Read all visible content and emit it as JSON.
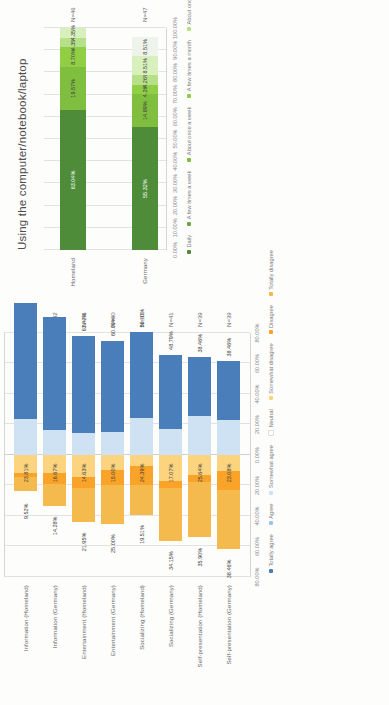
{
  "page": {
    "background": "#fdfdfc",
    "rotation_note": "scanned page oriented 90 degrees counter-clockwise"
  },
  "chart_data": [
    {
      "id": "likert-chart",
      "type": "bar",
      "subtype": "diverging-stacked-bar",
      "title": "",
      "xlabel": "",
      "ylabel": "",
      "grid": true,
      "legend_position": "bottom",
      "xlim": [
        -80,
        80
      ],
      "xtick_labels": [
        "80.00%",
        "60.00%",
        "40.00%",
        "20.00%",
        "0.00%",
        "20.00%",
        "40.00%",
        "60.00%",
        "80.00%"
      ],
      "xtick_values": [
        -80,
        -60,
        -40,
        -20,
        0,
        20,
        40,
        60,
        80
      ],
      "categories": [
        "Information (Homeland)",
        "Information (Germany)",
        "Entertainment (Homeland)",
        "Entertainment (Germany)",
        "Socializing (Homeland)",
        "Socializing (Germany)",
        "Self-presentation (Homeland)",
        "Self-presentation (Germany)"
      ],
      "n_labels": [
        "N=42",
        "N=42",
        "N=41",
        "N=40",
        "N=41",
        "N=41",
        "N=39",
        "N=39"
      ],
      "series": [
        {
          "name": "Totally disagree",
          "color": "#f5ba4e",
          "values": [
            9.52,
            14.28,
            21.95,
            25.0,
            19.51,
            34.15,
            35.9,
            38.46
          ]
        },
        {
          "name": "Disagree",
          "color": "#f9a328",
          "values": [
            2.38,
            7.14,
            7.32,
            10.0,
            12.2,
            4.88,
            5.13,
            12.82
          ]
        },
        {
          "name": "Somewhat disagree",
          "color": "#fcd37f",
          "values": [
            11.9,
            11.9,
            14.63,
            10.0,
            7.32,
            17.07,
            12.82,
            10.26
          ]
        },
        {
          "name": "Neutral",
          "color": "#ffffff",
          "values": [
            0,
            0,
            0,
            0,
            0,
            0,
            0,
            0
          ]
        },
        {
          "name": "Somewhat agree",
          "color": "#cfe2f3",
          "values": [
            23.81,
            16.67,
            14.63,
            15.0,
            24.39,
            17.07,
            25.64,
            23.08
          ]
        },
        {
          "name": "Agree",
          "color": "#9dc3e6",
          "values": [
            0,
            0,
            0,
            0,
            0,
            0,
            0,
            0
          ]
        },
        {
          "name": "Totally agree",
          "color": "#4a7ebb",
          "values": [
            76.19,
            73.81,
            63.42,
            60.0,
            56.1,
            48.79,
            38.46,
            38.46
          ]
        }
      ],
      "left_value_labels": [
        "9.52%",
        "14.28%",
        "21.95%",
        "25.00%",
        "19.51%",
        "34.15%",
        "35.90%",
        "38.46%"
      ],
      "neutral_value_labels": [
        "23.81%",
        "16.67%",
        "14.63%",
        "15.00%",
        "24.39%",
        "17.07%",
        "25.64%",
        "23.08%"
      ],
      "right_value_labels": [
        "",
        "",
        "63.42%",
        "60.00%",
        "56.10%",
        "48.79%",
        "38.46%",
        "38.46%"
      ],
      "legend": [
        "Totally agree",
        "Agree",
        "Somewhat agree",
        "Neutral",
        "Somewhat disagree",
        "Disagree",
        "Totally disagree"
      ]
    },
    {
      "id": "usage-frequency-chart",
      "type": "bar",
      "subtype": "stacked-bar-100",
      "title": "Using the computer/notebook/laptop",
      "xlabel": "",
      "ylabel": "",
      "grid": true,
      "legend_position": "bottom",
      "xlim": [
        0,
        100
      ],
      "xtick_labels": [
        "0.00%",
        "10.00%",
        "20.00%",
        "30.00%",
        "40.00%",
        "50.00%",
        "60.00%",
        "70.00%",
        "80.00%",
        "90.00%",
        "100.00%"
      ],
      "xtick_values": [
        0,
        10,
        20,
        30,
        40,
        50,
        60,
        70,
        80,
        90,
        100
      ],
      "categories": [
        "Homeland",
        "Germany"
      ],
      "n_labels": [
        "N=46",
        "N=47"
      ],
      "series": [
        {
          "name": "Daily",
          "color": "#4e8c3a",
          "values": [
            63.04,
            55.32
          ]
        },
        {
          "name": "A few times a week",
          "color": "#6aa844",
          "values": [
            0,
            0
          ]
        },
        {
          "name": "About once a week",
          "color": "#7fbe3f",
          "values": [
            19.57,
            14.89
          ]
        },
        {
          "name": "A few times a month",
          "color": "#8fce45",
          "values": [
            8.7,
            4.26
          ]
        },
        {
          "name": "About once a month",
          "color": "#b7e08a",
          "values": [
            4.35,
            4.26
          ]
        },
        {
          "name": "A few times a year",
          "color": "#d8f0bc",
          "values": [
            4.35,
            8.51
          ]
        },
        {
          "name": "Never",
          "color": "#eef3ec",
          "values": [
            0,
            8.51
          ]
        }
      ],
      "value_labels": {
        "Homeland": [
          "63.04%",
          "19.57%",
          "8.70%",
          "4.35%",
          "4.35%"
        ],
        "Germany": [
          "55.32%",
          "14.89%",
          "4.26%",
          "4.26%",
          "8.51%",
          "8.51%"
        ]
      },
      "legend": [
        "Daily",
        "A few times a week",
        "About once a week",
        "A few times a month",
        "About once a month",
        "A few times a year",
        "Never"
      ]
    }
  ]
}
